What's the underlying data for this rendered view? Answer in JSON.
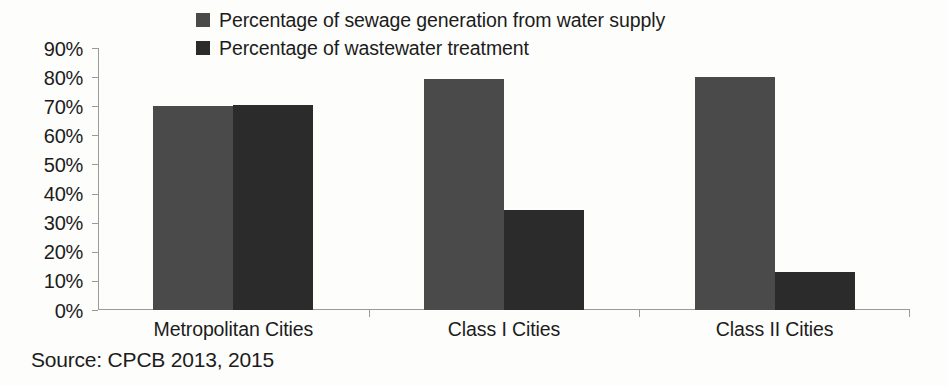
{
  "chart_data": {
    "type": "bar",
    "title": "",
    "xlabel": "",
    "ylabel": "",
    "categories": [
      "Metropolitan Cities",
      "Class I Cities",
      "Class II Cities"
    ],
    "series": [
      {
        "name": "Percentage of sewage generation from water supply",
        "color": "#4a4a4a",
        "values": [
          70,
          79.5,
          80
        ]
      },
      {
        "name": "Percentage of wastewater treatment",
        "color": "#2b2b2b",
        "values": [
          70.5,
          34.5,
          13
        ]
      }
    ],
    "ylim": [
      0,
      90
    ],
    "ytick_step": 10,
    "ytick_labels": [
      "0%",
      "10%",
      "20%",
      "30%",
      "40%",
      "50%",
      "60%",
      "70%",
      "80%",
      "90%"
    ],
    "ytick_values": [
      0,
      10,
      20,
      30,
      40,
      50,
      60,
      70,
      80,
      90
    ],
    "grid": false,
    "legend_position": "top-left",
    "source_note": "Source: CPCB 2013, 2015",
    "axis_color": "#9a9a9a",
    "background_color": "#fdfdfb",
    "text_color": "#1c1c1c"
  }
}
